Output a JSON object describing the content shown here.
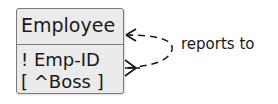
{
  "entity": {
    "name": "Employee",
    "attributes": [
      {
        "text": "! Emp-ID",
        "kind": "primary-key"
      },
      {
        "text": "[ ^Boss ]",
        "kind": "foreign-key"
      }
    ]
  },
  "relationship": {
    "label": "reports to",
    "from_end": "crow-foot-many",
    "to_end": "arrow-one",
    "line_style": "dashed"
  },
  "colors": {
    "entity_fill": "#ebebeb",
    "entity_border": "#7a7a7a",
    "text": "#1a1a1a"
  }
}
